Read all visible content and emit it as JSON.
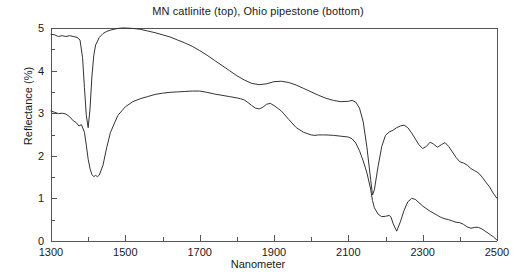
{
  "chart_data": {
    "type": "line",
    "title": "MN catlinite (top), Ohio pipestone (bottom)",
    "xlabel": "Nanometer",
    "ylabel": "Reflectance (%)",
    "xlim": [
      1300,
      2500
    ],
    "ylim": [
      0,
      5
    ],
    "xticks": [
      1300,
      1500,
      1700,
      1900,
      2100,
      2300,
      2500
    ],
    "xticklabels": [
      "1300",
      "1500",
      "1700",
      "1900",
      "2100",
      "2300",
      "2500"
    ],
    "xminor_step": 100,
    "yticks": [
      0,
      1,
      2,
      3,
      4,
      5
    ],
    "yticklabels": [
      "0",
      "1",
      "2",
      "3",
      "4",
      "5"
    ],
    "yminor_step": 0.5,
    "grid": false,
    "legend": "none",
    "line_color": "#333333",
    "axis_color": "#555555",
    "background": "#ffffff",
    "series": [
      {
        "name": "MN catlinite (top)",
        "x": [
          1300,
          1310,
          1320,
          1330,
          1340,
          1350,
          1360,
          1370,
          1378,
          1385,
          1390,
          1395,
          1400,
          1405,
          1410,
          1415,
          1420,
          1430,
          1440,
          1450,
          1460,
          1470,
          1480,
          1490,
          1500,
          1520,
          1540,
          1560,
          1580,
          1600,
          1620,
          1640,
          1660,
          1680,
          1700,
          1720,
          1740,
          1760,
          1780,
          1800,
          1820,
          1840,
          1860,
          1880,
          1900,
          1920,
          1940,
          1960,
          1980,
          2000,
          2020,
          2040,
          2060,
          2080,
          2100,
          2110,
          2120,
          2130,
          2140,
          2150,
          2160,
          2165,
          2170,
          2180,
          2190,
          2200,
          2210,
          2220,
          2230,
          2240,
          2250,
          2260,
          2270,
          2280,
          2290,
          2300,
          2310,
          2320,
          2330,
          2340,
          2350,
          2360,
          2370,
          2380,
          2390,
          2400,
          2410,
          2420,
          2430,
          2440,
          2450,
          2460,
          2470,
          2480,
          2490,
          2500
        ],
        "y": [
          4.85,
          4.84,
          4.8,
          4.82,
          4.8,
          4.82,
          4.8,
          4.78,
          4.72,
          4.3,
          3.6,
          2.95,
          2.66,
          3.1,
          3.85,
          4.35,
          4.6,
          4.78,
          4.87,
          4.92,
          4.95,
          4.97,
          4.99,
          5.0,
          5.0,
          4.99,
          4.97,
          4.93,
          4.89,
          4.84,
          4.79,
          4.72,
          4.65,
          4.57,
          4.47,
          4.36,
          4.24,
          4.12,
          4.0,
          3.88,
          3.78,
          3.7,
          3.67,
          3.69,
          3.74,
          3.75,
          3.72,
          3.66,
          3.58,
          3.5,
          3.42,
          3.35,
          3.3,
          3.27,
          3.28,
          3.3,
          3.26,
          3.12,
          2.8,
          2.2,
          1.45,
          1.08,
          1.2,
          1.75,
          2.22,
          2.48,
          2.56,
          2.6,
          2.66,
          2.7,
          2.72,
          2.66,
          2.54,
          2.4,
          2.26,
          2.17,
          2.22,
          2.32,
          2.27,
          2.2,
          2.26,
          2.31,
          2.22,
          2.09,
          1.96,
          1.86,
          1.83,
          1.78,
          1.7,
          1.65,
          1.6,
          1.5,
          1.38,
          1.27,
          1.12,
          1.0
        ]
      },
      {
        "name": "Ohio pipestone (bottom)",
        "x": [
          1300,
          1310,
          1320,
          1330,
          1340,
          1350,
          1360,
          1368,
          1375,
          1382,
          1390,
          1395,
          1400,
          1405,
          1410,
          1415,
          1420,
          1425,
          1430,
          1440,
          1450,
          1460,
          1480,
          1500,
          1520,
          1540,
          1560,
          1580,
          1600,
          1620,
          1640,
          1660,
          1680,
          1700,
          1720,
          1740,
          1760,
          1780,
          1800,
          1810,
          1820,
          1830,
          1840,
          1850,
          1860,
          1870,
          1880,
          1890,
          1900,
          1920,
          1940,
          1960,
          1980,
          2000,
          2010,
          2020,
          2030,
          2040,
          2060,
          2080,
          2100,
          2110,
          2120,
          2130,
          2140,
          2150,
          2160,
          2165,
          2170,
          2180,
          2190,
          2200,
          2210,
          2215,
          2220,
          2230,
          2240,
          2250,
          2260,
          2270,
          2280,
          2290,
          2300,
          2320,
          2340,
          2350,
          2360,
          2370,
          2380,
          2390,
          2400,
          2410,
          2420,
          2430,
          2440,
          2450,
          2460,
          2470,
          2480,
          2490,
          2500
        ],
        "y": [
          3.05,
          3.02,
          2.99,
          3.0,
          2.98,
          2.92,
          2.82,
          2.78,
          2.7,
          2.73,
          2.55,
          2.25,
          1.92,
          1.7,
          1.56,
          1.51,
          1.54,
          1.51,
          1.55,
          1.78,
          2.2,
          2.55,
          2.95,
          3.15,
          3.27,
          3.34,
          3.39,
          3.44,
          3.47,
          3.49,
          3.5,
          3.51,
          3.52,
          3.52,
          3.49,
          3.45,
          3.42,
          3.39,
          3.36,
          3.34,
          3.31,
          3.25,
          3.18,
          3.12,
          3.1,
          3.14,
          3.21,
          3.23,
          3.18,
          3.05,
          2.85,
          2.66,
          2.55,
          2.49,
          2.48,
          2.49,
          2.49,
          2.49,
          2.48,
          2.46,
          2.44,
          2.4,
          2.3,
          2.12,
          1.88,
          1.6,
          1.22,
          0.95,
          0.78,
          0.63,
          0.57,
          0.58,
          0.6,
          0.56,
          0.42,
          0.23,
          0.45,
          0.72,
          0.92,
          1.0,
          0.98,
          0.9,
          0.82,
          0.7,
          0.6,
          0.55,
          0.52,
          0.5,
          0.47,
          0.44,
          0.43,
          0.39,
          0.33,
          0.3,
          0.32,
          0.32,
          0.28,
          0.22,
          0.16,
          0.1,
          0.02
        ]
      }
    ]
  }
}
